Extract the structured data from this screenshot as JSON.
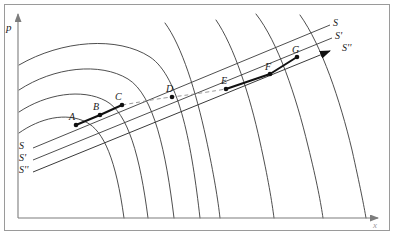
{
  "figure": {
    "kind": "line-diagram",
    "background": "#ffffff",
    "frame_color": "#8a8a8a",
    "ink_color": "#3a3a3a",
    "accent_color": "#111111"
  },
  "axes": {
    "y_label": "p",
    "x_label": "x",
    "y_axis_name": "price-axis",
    "x_axis_name": "quantity-axis",
    "origin": {
      "x": 18,
      "y": 218
    },
    "x_end": {
      "x": 378,
      "y": 218
    },
    "y_end": {
      "x": 18,
      "y": 14
    }
  },
  "chart_data": {
    "type": "line",
    "title": "",
    "xlabel": "x",
    "ylabel": "p",
    "grid": false,
    "legend": "none",
    "demand_curves": [
      {
        "name": "d1",
        "path": "M 19 133 C 40 118, 66 112, 86 122 C 104 131, 116 160, 124 218"
      },
      {
        "name": "d2",
        "path": "M 19 112 C 46 94, 82 88, 106 101 C 128 113, 140 156, 148 218"
      },
      {
        "name": "d3",
        "path": "M 19 90 C 54 67, 100 62, 128 79 C 154 95, 166 152, 174 218"
      },
      {
        "name": "d4",
        "path": "M 19 65 C 62 40, 118 36, 150 57 C 180 77, 192 148, 200 218"
      },
      {
        "name": "d5",
        "path": "M 165 23 C 182 46, 196 92, 206 138 C 214 175, 218 200, 220 218"
      },
      {
        "name": "d6",
        "path": "M 216 20 C 234 46, 250 96, 260 142 C 268 178, 272 202, 274 218"
      },
      {
        "name": "d7",
        "path": "M 256 14 C 278 42, 296 96, 308 146 C 317 182, 321 204, 323 218"
      },
      {
        "name": "d8",
        "path": "M 300 15 C 322 46, 340 100, 352 150 C 360 186, 364 206, 366 218"
      }
    ],
    "supply_lines": [
      {
        "name": "S",
        "label": "S",
        "x1": 33,
        "y1": 148,
        "x2": 330,
        "y2": 25
      },
      {
        "name": "S1",
        "label": "S'",
        "x1": 33,
        "y1": 160,
        "x2": 332,
        "y2": 38
      },
      {
        "name": "S2",
        "label": "S''",
        "x1": 33,
        "y1": 172,
        "x2": 330,
        "y2": 51,
        "arrow": true
      }
    ],
    "equilibrium_points": [
      {
        "label": "A",
        "x": 76,
        "y": 125,
        "lx": 69,
        "ly": 112
      },
      {
        "label": "B",
        "x": 100,
        "y": 115,
        "lx": 93,
        "ly": 102
      },
      {
        "label": "C",
        "x": 122,
        "y": 105,
        "lx": 115,
        "ly": 92
      },
      {
        "label": "D",
        "x": 172,
        "y": 97,
        "lx": 166,
        "ly": 84
      },
      {
        "label": "E",
        "x": 226,
        "y": 89,
        "lx": 221,
        "ly": 76
      },
      {
        "label": "F",
        "x": 270,
        "y": 74,
        "lx": 265,
        "ly": 62
      },
      {
        "label": "G",
        "x": 297,
        "y": 57,
        "lx": 292,
        "ly": 45
      }
    ],
    "dashed_path": {
      "name": "envelope-dashed",
      "path": "M 122 105 C 146 101, 162 98, 172 97 C 196 94, 214 91, 226 89"
    },
    "bold_segments": [
      {
        "from": "A",
        "to": "B"
      },
      {
        "from": "B",
        "to": "C"
      },
      {
        "from": "E",
        "to": "F"
      },
      {
        "from": "F",
        "to": "G"
      }
    ]
  },
  "labels": {
    "left_supply": [
      {
        "name": "supply-label-S-left",
        "text": "S",
        "x": 19,
        "y": 141
      },
      {
        "name": "supply-label-S1-left",
        "text": "S'",
        "x": 19,
        "y": 153
      },
      {
        "name": "supply-label-S2-left",
        "text": "S''",
        "x": 19,
        "y": 165
      }
    ],
    "right_supply": [
      {
        "name": "supply-label-S-right",
        "text": "S",
        "x": 333,
        "y": 18
      },
      {
        "name": "supply-label-S1-right",
        "text": "S'",
        "x": 335,
        "y": 31
      },
      {
        "name": "supply-label-S2-right",
        "text": "S''",
        "x": 342,
        "y": 43
      }
    ]
  }
}
